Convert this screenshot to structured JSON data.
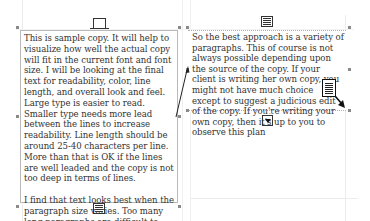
{
  "canvas": {
    "width": 370,
    "height": 221,
    "background": "#ffffff"
  },
  "left_frame": {
    "text": "This is sample copy. It will help to visualize how well the actual copy will fit in the current font and font size. I will be looking at the final text for readability, color, line length, and overall look and feel. Large type is easier to read. Smaller type needs more lead between the lines to increase readability. Line length should be around 25-40 characters per line. More than that is OK if the lines are well leaded and the copy is not too deep in terms of lines.\n\nI find that text looks best when the paragraph size varies. Too many long paragraphs are difficult to read and discourage readership. On the other hand, too many short paragraphs look choppy.",
    "in_port_icon": "empty-inport-icon",
    "out_port_icon": "text-outport-icon",
    "border_color": "#b9b9b9"
  },
  "right_frame": {
    "text": "So the best approach is a variety of paragraphs. This of course is not always possible depending upon the source of the copy. If your client is writing her own copy, you might not have much choice except to suggest a judicious edit of the copy. If you're writing your own copy, then it's up to you to observe this plan",
    "in_port_icon": "threaded-inport-icon",
    "out_port_icon": "overset-outport-icon",
    "border_style": "dotted"
  },
  "thread_link": {
    "from": [
      176,
      117
    ],
    "to": [
      188,
      68
    ],
    "color": "#222222"
  },
  "cursor": {
    "type": "loaded-text-cursor-icon",
    "arrow_color": "#111111"
  }
}
